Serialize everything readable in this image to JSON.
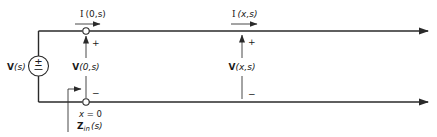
{
  "diagram": {
    "source": {
      "label": "V(s)",
      "label_main": "V",
      "label_arg": "(s)",
      "symbol": "±"
    },
    "input_current": {
      "label_main": "I",
      "label_arg": "(0,s)"
    },
    "input_voltage": {
      "label_main": "V",
      "label_arg": "(0,s)",
      "plus": "+",
      "minus": "−"
    },
    "line_current": {
      "label_main": "I",
      "label_arg": "(x,s)"
    },
    "line_voltage": {
      "label_main": "V",
      "label_arg": "(x,s)",
      "plus": "+",
      "minus": "−"
    },
    "position_label": {
      "var": "x",
      "eq": " = 0"
    },
    "input_impedance": {
      "label_main": "Z",
      "label_sub": "in",
      "label_arg": "(s)"
    },
    "colors": {
      "line": "#2a2a2a",
      "text": "#1a1a1a",
      "background": "#ffffff"
    }
  }
}
